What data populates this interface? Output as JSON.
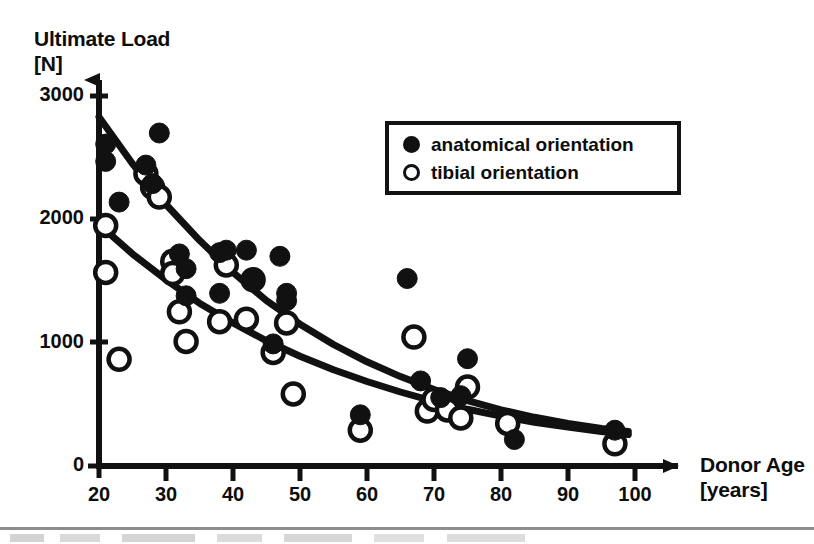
{
  "chart_data": {
    "type": "scatter",
    "title": "",
    "xlabel": "Donor Age [years]",
    "ylabel": "Ultimate Load [N]",
    "xlabel_line1": "Donor Age",
    "xlabel_line2": "[years]",
    "ylabel_line1": "Ultimate Load",
    "ylabel_line2": "[N]",
    "xlim": [
      20,
      100
    ],
    "ylim": [
      0,
      3000
    ],
    "xticks": [
      20,
      30,
      40,
      50,
      60,
      70,
      80,
      90,
      100
    ],
    "yticks": [
      0,
      1000,
      2000,
      3000
    ],
    "xtick_labels": [
      "20",
      "30",
      "40",
      "50",
      "60",
      "70",
      "80",
      "90",
      "100"
    ],
    "ytick_labels": [
      "0",
      "1000",
      "2000",
      "3000"
    ],
    "grid": false,
    "legend_position": "upper-right",
    "axis_style": "arrow-ended-L-axes",
    "series": [
      {
        "name": "anatomical orientation",
        "marker": "filled-circle",
        "color": "#111111",
        "points": [
          [
            21,
            2610
          ],
          [
            21,
            2470
          ],
          [
            23,
            2140
          ],
          [
            27,
            2440
          ],
          [
            28,
            2290
          ],
          [
            29,
            2700
          ],
          [
            32,
            1720
          ],
          [
            33,
            1600
          ],
          [
            33,
            1380
          ],
          [
            38,
            1400
          ],
          [
            38,
            1730
          ],
          [
            39,
            1750
          ],
          [
            42,
            1750
          ],
          [
            43,
            1520
          ],
          [
            46,
            990
          ],
          [
            47,
            1700
          ],
          [
            48,
            1400
          ],
          [
            48,
            1340
          ],
          [
            59,
            415
          ],
          [
            66,
            1520
          ],
          [
            68,
            690
          ],
          [
            71,
            555
          ],
          [
            74,
            570
          ],
          [
            75,
            870
          ],
          [
            82,
            215
          ],
          [
            97,
            290
          ]
        ]
      },
      {
        "name": "tibial orientation",
        "marker": "open-circle",
        "color": "#111111",
        "points": [
          [
            21,
            1950
          ],
          [
            21,
            1570
          ],
          [
            23,
            865
          ],
          [
            27,
            2370
          ],
          [
            28,
            2260
          ],
          [
            29,
            2180
          ],
          [
            31,
            1660
          ],
          [
            31,
            1560
          ],
          [
            32,
            1250
          ],
          [
            33,
            1010
          ],
          [
            38,
            1170
          ],
          [
            39,
            1630
          ],
          [
            42,
            1190
          ],
          [
            43,
            1510
          ],
          [
            46,
            920
          ],
          [
            48,
            1160
          ],
          [
            49,
            585
          ],
          [
            59,
            290
          ],
          [
            67,
            1045
          ],
          [
            69,
            445
          ],
          [
            70,
            540
          ],
          [
            72,
            455
          ],
          [
            74,
            390
          ],
          [
            75,
            640
          ],
          [
            81,
            345
          ],
          [
            97,
            180
          ]
        ]
      }
    ],
    "fit_curves": [
      {
        "name": "anatomical orientation fit",
        "type": "exponential-decay",
        "style": "solid-thick",
        "color": "#111111",
        "xy": [
          [
            20,
            2830
          ],
          [
            25,
            2450
          ],
          [
            30,
            2120
          ],
          [
            35,
            1830
          ],
          [
            40,
            1570
          ],
          [
            45,
            1340
          ],
          [
            50,
            1150
          ],
          [
            55,
            985
          ],
          [
            60,
            845
          ],
          [
            65,
            725
          ],
          [
            70,
            620
          ],
          [
            75,
            530
          ],
          [
            80,
            455
          ],
          [
            85,
            395
          ],
          [
            90,
            345
          ],
          [
            95,
            305
          ],
          [
            99,
            280
          ]
        ]
      },
      {
        "name": "tibial orientation fit",
        "type": "exponential-decay",
        "style": "solid-thick",
        "color": "#111111",
        "xy": [
          [
            20,
            1960
          ],
          [
            25,
            1720
          ],
          [
            30,
            1510
          ],
          [
            35,
            1320
          ],
          [
            40,
            1160
          ],
          [
            45,
            1015
          ],
          [
            50,
            890
          ],
          [
            55,
            780
          ],
          [
            60,
            685
          ],
          [
            65,
            600
          ],
          [
            70,
            525
          ],
          [
            75,
            460
          ],
          [
            80,
            405
          ],
          [
            85,
            355
          ],
          [
            90,
            315
          ],
          [
            95,
            280
          ],
          [
            99,
            255
          ]
        ]
      }
    ]
  },
  "legend": {
    "entries": [
      {
        "label": "anatomical orientation",
        "marker": "filled-circle"
      },
      {
        "label": "tibial orientation",
        "marker": "open-circle"
      }
    ]
  },
  "colors": {
    "ink": "#111111",
    "background": "#ffffff",
    "rule": "#8d8d8d"
  }
}
